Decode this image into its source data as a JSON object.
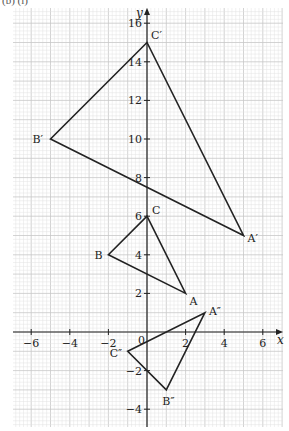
{
  "caption": "(b) (i)",
  "grid": {
    "left_px": 13,
    "right_px": 283,
    "top_px": 8,
    "bottom_px": 427,
    "origin_px": [
      147,
      332
    ],
    "unit_px": 19.3,
    "minor_per_unit": 5,
    "minor_color": "#e3e3e3",
    "major_color": "#c8c8c8"
  },
  "axes": {
    "x_label": "x",
    "y_label": "y",
    "x_ticks": [
      -6,
      -4,
      -2,
      2,
      4,
      6
    ],
    "y_ticks": [
      -4,
      -2,
      2,
      4,
      6,
      8,
      10,
      12,
      14,
      16
    ],
    "origin_label": "0",
    "color": "#222222"
  },
  "triangles": [
    {
      "name": "ABC",
      "vertices": [
        {
          "label": "A",
          "x": 2,
          "y": 2,
          "dx": 4,
          "dy": 12
        },
        {
          "label": "B",
          "x": -2,
          "y": 4,
          "dx": -14,
          "dy": 4
        },
        {
          "label": "C",
          "x": 0,
          "y": 6,
          "dx": 5,
          "dy": -2
        }
      ]
    },
    {
      "name": "A'B'C'",
      "vertices": [
        {
          "label": "A′",
          "x": 5,
          "y": 5,
          "dx": 4,
          "dy": 6
        },
        {
          "label": "B′",
          "x": -5,
          "y": 10,
          "dx": -18,
          "dy": 4
        },
        {
          "label": "C′",
          "x": 0,
          "y": 15,
          "dx": 4,
          "dy": -4
        }
      ]
    },
    {
      "name": "A''B''C''",
      "vertices": [
        {
          "label": "A″",
          "x": 3,
          "y": 1,
          "dx": 4,
          "dy": 2
        },
        {
          "label": "B″",
          "x": 1,
          "y": -3,
          "dx": -4,
          "dy": 15
        },
        {
          "label": "C″",
          "x": -1,
          "y": -1,
          "dx": -18,
          "dy": 6
        }
      ]
    }
  ],
  "line_color": "#222222"
}
